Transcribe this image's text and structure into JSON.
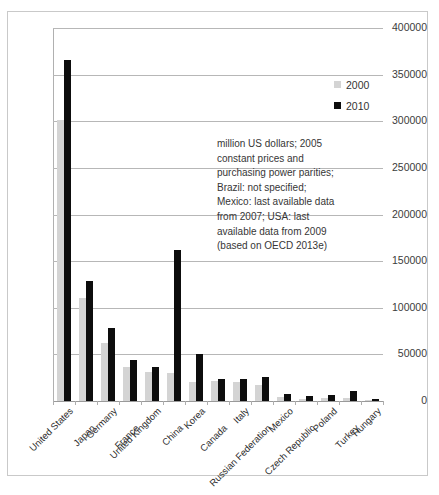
{
  "chart_data": {
    "type": "bar",
    "title": "",
    "subtitle": "",
    "xlabel": "",
    "ylabel": "",
    "ylim": [
      0,
      400000
    ],
    "ytick_values": [
      0,
      50000,
      100000,
      150000,
      200000,
      250000,
      300000,
      350000,
      400000
    ],
    "ytick_labels": [
      "0",
      "50000",
      "100000",
      "150000",
      "200000",
      "250000",
      "300000",
      "350000",
      "400000"
    ],
    "grid": true,
    "legend_position": "top-right",
    "categories": [
      "United States",
      "Japan",
      "Germany",
      "France",
      "United Kingdom",
      "China",
      "Korea",
      "Canada",
      "Italy",
      "Russian Federation",
      "Mexico",
      "Czech Republic",
      "Poland",
      "Turkey",
      "Hungary"
    ],
    "series": [
      {
        "name": "2000",
        "color": "#d4d4d4",
        "values": [
          301000,
          110000,
          62000,
          37000,
          31000,
          30000,
          20000,
          22000,
          20000,
          17000,
          4500,
          2600,
          3000,
          3500,
          1500
        ]
      },
      {
        "name": "2010",
        "color": "#0d0d0d",
        "values": [
          366000,
          129000,
          78000,
          44000,
          36000,
          162000,
          50000,
          24000,
          24000,
          26000,
          7000,
          5000,
          6000,
          11000,
          2500
        ]
      }
    ],
    "annotation_lines": [
      "million US dollars; 2005",
      "constant prices and",
      "purchasing power parities;",
      "Brazil: not specified;",
      "Mexico: last available data",
      "from 2007; USA: last",
      "available data from 2009",
      "(based on OECD 2013e)"
    ]
  },
  "legend": {
    "items": [
      {
        "label": "2000",
        "swatch": "legend-swatch-2000"
      },
      {
        "label": "2010",
        "swatch": "legend-swatch-2010"
      }
    ]
  },
  "colors": {
    "series_2000": "#d4d4d4",
    "series_2010": "#0d0d0d",
    "gridline": "#b7b7b7",
    "axis": "#b0b0b0",
    "frame": "#c9c9c9",
    "text": "#333333",
    "background": "#ffffff"
  }
}
